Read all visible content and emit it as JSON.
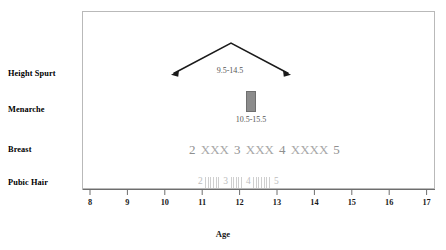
{
  "chart_data": {
    "type": "table",
    "title": "",
    "xlabel": "Age",
    "ylabel": "",
    "xlim": [
      7.5,
      17.5
    ],
    "xticks": [
      8,
      9,
      10,
      11,
      12,
      13,
      14,
      15,
      16,
      17
    ],
    "xtick_labels": [
      "8",
      "9",
      "10",
      "11",
      "12",
      "13",
      "14",
      "15",
      "16",
      "17"
    ],
    "grid": false,
    "legend": false,
    "rows": [
      {
        "label": "Height Spurt",
        "kind": "peak-range",
        "range_label": "9.5-14.5",
        "start": 9.9,
        "peak": 11.5,
        "end": 13.1
      },
      {
        "label": "Menarche",
        "kind": "bar",
        "range_label": "10.5-15.5",
        "start": 12.1,
        "end": 12.4
      },
      {
        "label": "Breast",
        "kind": "stages",
        "sequence": "2 XXX 3 XXX 4 XXXX 5",
        "stages": [
          "2",
          "3",
          "4",
          "5"
        ],
        "separators": [
          "XXX",
          "XXX",
          "XXXX"
        ],
        "start": 10.4,
        "end": 14.2
      },
      {
        "label": "Pubic Hair",
        "kind": "stages-hatched",
        "sequence": "2 ||||| 3 |||| 4 |||||| 5",
        "stages": [
          "2",
          "3",
          "4",
          "5"
        ],
        "hatch_counts": [
          6,
          5,
          7
        ],
        "start": 10.6,
        "end": 13.8
      }
    ]
  },
  "axis": {
    "title": "Age",
    "ticks": [
      "8",
      "9",
      "10",
      "11",
      "12",
      "13",
      "14",
      "15",
      "16",
      "17"
    ]
  },
  "rows": {
    "height_spurt": {
      "label": "Height Spurt",
      "range": "9.5-14.5"
    },
    "menarche": {
      "label": "Menarche",
      "range": "10.5-15.5"
    },
    "breast": {
      "label": "Breast",
      "stage_2": "2",
      "stage_3": "3",
      "stage_4": "4",
      "stage_5": "5",
      "sep_1": "XXX",
      "sep_2": "XXX",
      "sep_3": "XXXX"
    },
    "pubic_hair": {
      "label": "Pubic Hair",
      "stage_2": "2",
      "stage_3": "3",
      "stage_4": "4",
      "stage_5": "5"
    }
  },
  "colors": {
    "frame": "#b9b9b9",
    "line": "#1a1a1a",
    "menarche_fill": "#8c8c8c",
    "menarche_stroke": "#6f6f6f",
    "breast_text": "#9a9a9a",
    "pubic_text": "#c4c4c4",
    "hatch": "#cfcfcf",
    "label_text": "#000000",
    "range_text": "#555555"
  }
}
